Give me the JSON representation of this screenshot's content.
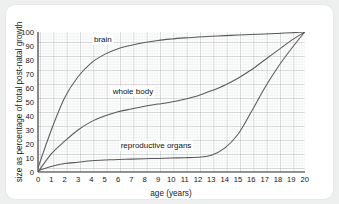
{
  "card": {
    "background": "#ffffff",
    "page_background": "#eef0ef"
  },
  "chart_data": {
    "type": "line",
    "title": "",
    "xlabel": "age (years)",
    "ylabel": "size as percentage of total post-natal growth",
    "xlim": [
      0,
      20
    ],
    "ylim": [
      0,
      100
    ],
    "xticks": [
      "0",
      "1",
      "2",
      "3",
      "4",
      "5",
      "6",
      "7",
      "8",
      "9",
      "10",
      "11",
      "12",
      "13",
      "14",
      "15",
      "16",
      "17",
      "18",
      "19",
      "20"
    ],
    "yticks": [
      "0",
      "10",
      "20",
      "30",
      "40",
      "50",
      "60",
      "70",
      "80",
      "90",
      "100"
    ],
    "grid": "major and minor graph-paper grid",
    "legend_position": "inline labels on curves",
    "x": [
      0,
      1,
      2,
      3,
      4,
      5,
      6,
      7,
      8,
      9,
      10,
      11,
      12,
      13,
      14,
      15,
      16,
      17,
      18,
      19,
      20
    ],
    "series": [
      {
        "name": "brain",
        "color": "#5a5a5a",
        "label_x": 4.2,
        "label_y": 93,
        "values": [
          3,
          30,
          53,
          68,
          78,
          84,
          88,
          90.5,
          92.5,
          94,
          95,
          95.8,
          96.5,
          97,
          97.4,
          97.8,
          98.2,
          98.6,
          99,
          99.5,
          100
        ]
      },
      {
        "name": "whole body",
        "color": "#5a5a5a",
        "label_x": 5.6,
        "label_y": 56,
        "values": [
          0,
          13,
          22,
          30,
          36,
          40,
          43,
          45,
          47,
          48.5,
          50,
          52,
          54.5,
          58,
          62,
          67,
          73,
          80,
          87,
          94,
          100
        ]
      },
      {
        "name": "reproductive organs",
        "color": "#5a5a5a",
        "label_x": 6.2,
        "label_y": 17,
        "values": [
          1,
          4,
          6,
          7,
          8,
          8.5,
          9,
          9.2,
          9.5,
          9.7,
          10,
          10.2,
          10.6,
          12,
          17,
          27,
          43,
          60,
          75,
          88,
          100
        ]
      }
    ]
  }
}
